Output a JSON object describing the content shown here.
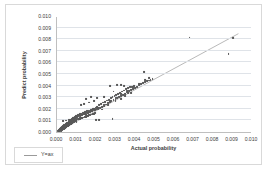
{
  "chart_data": {
    "type": "scatter",
    "title": "",
    "xlabel": "Actual probability",
    "ylabel": "Predict probability",
    "xlim": [
      0.0,
      0.01
    ],
    "ylim": [
      0.0,
      0.01
    ],
    "xticks": [
      "0.000",
      "0.001",
      "0.002",
      "0.003",
      "0.004",
      "0.005",
      "0.006",
      "0.007",
      "0.008",
      "0.009",
      "0.010"
    ],
    "yticks": [
      "0.000",
      "0.001",
      "0.002",
      "0.003",
      "0.004",
      "0.005",
      "0.006",
      "0.007",
      "0.008",
      "0.009",
      "0.010"
    ],
    "xtick_values": [
      0.0,
      0.001,
      0.002,
      0.003,
      0.004,
      0.005,
      0.006,
      0.007,
      0.008,
      0.009,
      0.01
    ],
    "ytick_values": [
      0.0,
      0.001,
      0.002,
      0.003,
      0.004,
      0.005,
      0.006,
      0.007,
      0.008,
      0.009,
      0.01
    ],
    "grid": "horizontal",
    "legend_position": "below-left",
    "legend": [
      {
        "label": "Y=ax",
        "marker": "line",
        "color": "#9a9a9a"
      }
    ],
    "series": [
      {
        "name": "scatter-points",
        "type": "scatter",
        "color": "#595959",
        "marker": "diamond",
        "points": [
          [
            5e-05,
            8e-05
          ],
          [
            8e-05,
            0.00012
          ],
          [
            0.0001,
            6e-05
          ],
          [
            0.00011,
            0.00018
          ],
          [
            0.00012,
            0.0001
          ],
          [
            0.00013,
            0.00022
          ],
          [
            0.00014,
            0.00014
          ],
          [
            0.00015,
            0.00026
          ],
          [
            0.00016,
            0.00018
          ],
          [
            0.00017,
            0.0003
          ],
          [
            0.00018,
            0.00021
          ],
          [
            0.00019,
            0.00013
          ],
          [
            0.0002,
            0.00034
          ],
          [
            0.00021,
            0.00024
          ],
          [
            0.00022,
            0.00016
          ],
          [
            0.00023,
            0.00038
          ],
          [
            0.00024,
            0.00028
          ],
          [
            0.00025,
            0.00019
          ],
          [
            0.00026,
            0.00042
          ],
          [
            0.00027,
            0.00031
          ],
          [
            0.00028,
            0.00022
          ],
          [
            0.00029,
            0.00046
          ],
          [
            0.0003,
            0.00035
          ],
          [
            0.00031,
            0.00025
          ],
          [
            0.00032,
            0.0005
          ],
          [
            0.00033,
            0.00039
          ],
          [
            0.00034,
            0.00028
          ],
          [
            0.00035,
            0.00054
          ],
          [
            0.00036,
            0.00043
          ],
          [
            0.00037,
            0.00031
          ],
          [
            0.00038,
            0.00058
          ],
          [
            0.00039,
            0.00047
          ],
          [
            0.0004,
            0.00035
          ],
          [
            0.00041,
            0.00062
          ],
          [
            0.00042,
            0.00051
          ],
          [
            0.00043,
            0.00038
          ],
          [
            0.00044,
            0.00066
          ],
          [
            0.00045,
            0.00055
          ],
          [
            0.00046,
            0.00042
          ],
          [
            0.00047,
            0.0007
          ],
          [
            0.00048,
            0.00059
          ],
          [
            0.00049,
            0.00045
          ],
          [
            0.0005,
            0.00074
          ],
          [
            0.00051,
            0.00063
          ],
          [
            0.00052,
            0.00049
          ],
          [
            0.00053,
            0.00078
          ],
          [
            0.00054,
            0.00067
          ],
          [
            0.00055,
            0.00052
          ],
          [
            0.00056,
            0.00082
          ],
          [
            0.00057,
            0.00071
          ],
          [
            0.00058,
            0.00056
          ],
          [
            0.00059,
            0.00086
          ],
          [
            0.0006,
            0.00075
          ],
          [
            0.00061,
            0.00059
          ],
          [
            0.00062,
            0.0009
          ],
          [
            0.00063,
            0.00079
          ],
          [
            0.00064,
            0.00063
          ],
          [
            0.00065,
            0.00094
          ],
          [
            0.00066,
            0.00083
          ],
          [
            0.00067,
            0.00066
          ],
          [
            0.00068,
            0.00098
          ],
          [
            0.00069,
            0.00087
          ],
          [
            0.0007,
            0.0007
          ],
          [
            0.00071,
            0.00102
          ],
          [
            0.00072,
            0.00091
          ],
          [
            0.00073,
            0.00073
          ],
          [
            0.00074,
            0.00106
          ],
          [
            0.00075,
            0.00095
          ],
          [
            0.00076,
            0.00077
          ],
          [
            0.00077,
            0.0011
          ],
          [
            0.00078,
            0.00099
          ],
          [
            0.00079,
            0.0008
          ],
          [
            0.0008,
            0.00114
          ],
          [
            0.00081,
            0.00103
          ],
          [
            0.00082,
            0.00084
          ],
          [
            0.00083,
            0.00118
          ],
          [
            0.00084,
            0.00107
          ],
          [
            0.00085,
            0.00088
          ],
          [
            0.00086,
            0.00122
          ],
          [
            0.00087,
            0.00111
          ],
          [
            0.00088,
            0.00091
          ],
          [
            0.00089,
            0.00126
          ],
          [
            0.0009,
            0.00115
          ],
          [
            0.00091,
            0.00095
          ],
          [
            0.00092,
            0.0013
          ],
          [
            0.00093,
            0.00119
          ],
          [
            0.00094,
            0.00098
          ],
          [
            0.00095,
            0.00134
          ],
          [
            0.00096,
            0.00123
          ],
          [
            0.00097,
            0.00102
          ],
          [
            0.00098,
            0.00138
          ],
          [
            0.00099,
            0.00127
          ],
          [
            0.001,
            0.00105
          ],
          [
            0.00102,
            0.00142
          ],
          [
            0.00104,
            0.00131
          ],
          [
            0.00106,
            0.00109
          ],
          [
            0.00108,
            0.00146
          ],
          [
            0.0011,
            0.00135
          ],
          [
            0.00112,
            0.00112
          ],
          [
            0.00114,
            0.0015
          ],
          [
            0.00116,
            0.00139
          ],
          [
            0.00118,
            0.00116
          ],
          [
            0.0012,
            0.00154
          ],
          [
            0.00122,
            0.00143
          ],
          [
            0.00124,
            0.00119
          ],
          [
            0.00126,
            0.00158
          ],
          [
            0.00128,
            0.00147
          ],
          [
            0.0013,
            0.00123
          ],
          [
            0.00132,
            0.00162
          ],
          [
            0.00134,
            0.00151
          ],
          [
            0.00136,
            0.00126
          ],
          [
            0.00138,
            0.00166
          ],
          [
            0.0014,
            0.00155
          ],
          [
            0.00142,
            0.0013
          ],
          [
            0.00144,
            0.0017
          ],
          [
            0.00146,
            0.00159
          ],
          [
            0.00148,
            0.00133
          ],
          [
            0.0015,
            0.00174
          ],
          [
            0.00152,
            0.00163
          ],
          [
            0.00154,
            0.00137
          ],
          [
            0.00156,
            0.00178
          ],
          [
            0.00158,
            0.00167
          ],
          [
            0.0016,
            0.0014
          ],
          [
            0.00162,
            0.00182
          ],
          [
            0.00164,
            0.00171
          ],
          [
            0.00166,
            0.00144
          ],
          [
            0.00168,
            0.00186
          ],
          [
            0.0017,
            0.00175
          ],
          [
            0.00172,
            0.00147
          ],
          [
            0.00174,
            0.0019
          ],
          [
            0.00176,
            0.00179
          ],
          [
            0.00178,
            0.00151
          ],
          [
            0.0018,
            0.00194
          ],
          [
            0.00182,
            0.00183
          ],
          [
            0.00184,
            0.00154
          ],
          [
            0.00186,
            0.00198
          ],
          [
            0.00188,
            0.00187
          ],
          [
            0.0019,
            0.00158
          ],
          [
            0.00192,
            0.00202
          ],
          [
            0.00194,
            0.00191
          ],
          [
            0.00196,
            0.00161
          ],
          [
            0.00198,
            0.00206
          ],
          [
            0.002,
            0.00195
          ],
          [
            0.00205,
            0.00215
          ],
          [
            0.0021,
            0.002
          ],
          [
            0.00215,
            0.00235
          ],
          [
            0.0022,
            0.0021
          ],
          [
            0.00225,
            0.00245
          ],
          [
            0.0023,
            0.00218
          ],
          [
            0.00235,
            0.00255
          ],
          [
            0.0024,
            0.00228
          ],
          [
            0.00245,
            0.00262
          ],
          [
            0.0025,
            0.00238
          ],
          [
            0.00255,
            0.00272
          ],
          [
            0.0026,
            0.00248
          ],
          [
            0.00265,
            0.0028
          ],
          [
            0.0027,
            0.00256
          ],
          [
            0.00275,
            0.00292
          ],
          [
            0.0028,
            0.00266
          ],
          [
            0.00285,
            0.003
          ],
          [
            0.0029,
            0.00276
          ],
          [
            0.00295,
            0.0031
          ],
          [
            0.003,
            0.00285
          ],
          [
            0.00305,
            0.0032
          ],
          [
            0.0031,
            0.00295
          ],
          [
            0.00315,
            0.0033
          ],
          [
            0.0032,
            0.00302
          ],
          [
            0.00325,
            0.0034
          ],
          [
            0.0033,
            0.00312
          ],
          [
            0.00335,
            0.0035
          ],
          [
            0.0034,
            0.00322
          ],
          [
            0.00345,
            0.00358
          ],
          [
            0.0035,
            0.00332
          ],
          [
            0.00355,
            0.00368
          ],
          [
            0.0036,
            0.00342
          ],
          [
            0.00365,
            0.00378
          ],
          [
            0.0037,
            0.00352
          ],
          [
            0.00375,
            0.00385
          ],
          [
            0.0038,
            0.00362
          ],
          [
            0.00385,
            0.00392
          ],
          [
            0.0039,
            0.00372
          ],
          [
            0.00395,
            0.00398
          ],
          [
            0.004,
            0.00382
          ],
          [
            0.0041,
            0.00392
          ],
          [
            0.0042,
            0.00402
          ],
          [
            0.0043,
            0.00412
          ],
          [
            0.0044,
            0.0042
          ],
          [
            0.0045,
            0.0043
          ],
          [
            0.0046,
            0.00438
          ],
          [
            0.0047,
            0.00445
          ],
          [
            0.0048,
            0.00452
          ],
          [
            0.0049,
            0.00458
          ],
          [
            0.00048,
            0.001
          ],
          [
            0.0006,
            0.00102
          ],
          [
            0.00075,
            0.00104
          ],
          [
            0.0003,
            0.00098
          ],
          [
            0.002,
            0.00105
          ],
          [
            0.00215,
            0.00102
          ],
          [
            0.00285,
            0.0011
          ],
          [
            0.001,
            0.00085
          ],
          [
            0.00125,
            0.0023
          ],
          [
            0.0014,
            0.00245
          ],
          [
            0.00165,
            0.00255
          ],
          [
            0.0019,
            0.00268
          ],
          [
            0.00205,
            0.0029
          ],
          [
            0.0024,
            0.003
          ],
          [
            0.00175,
            0.003
          ],
          [
            0.0015,
            0.00285
          ],
          [
            0.0027,
            0.004
          ],
          [
            0.0031,
            0.00402
          ],
          [
            0.0033,
            0.00408
          ],
          [
            0.0029,
            0.0035
          ],
          [
            0.0033,
            0.00285
          ],
          [
            0.003,
            0.00265
          ],
          [
            0.0026,
            0.00235
          ],
          [
            0.0023,
            0.00195
          ],
          [
            0.0035,
            0.0031
          ],
          [
            0.0038,
            0.0034
          ],
          [
            0.00345,
            0.00395
          ],
          [
            0.00365,
            0.0034
          ],
          [
            0.00445,
            0.0052
          ],
          [
            0.0068,
            0.00815
          ],
          [
            0.00905,
            0.0081
          ],
          [
            0.0088,
            0.00675
          ],
          [
            0.0004,
            0.0004
          ],
          [
            0.0006,
            0.00058
          ],
          [
            0.0009,
            0.00088
          ],
          [
            0.0012,
            0.00118
          ],
          [
            0.0015,
            0.00148
          ],
          [
            0.0018,
            0.00178
          ],
          [
            0.0021,
            0.00208
          ],
          [
            0.0024,
            0.00238
          ],
          [
            0.0027,
            0.00268
          ],
          [
            0.003,
            0.00298
          ],
          [
            0.0033,
            0.00328
          ],
          [
            0.0036,
            0.00358
          ],
          [
            0.0039,
            0.00388
          ],
          [
            0.0042,
            0.00418
          ],
          [
            0.0045,
            0.00448
          ],
          [
            0.0047,
            0.00465
          ]
        ]
      },
      {
        "name": "Y=ax",
        "type": "line",
        "color": "#9a9a9a",
        "line_from": [
          0.00022,
          0.0002
        ],
        "line_to": [
          0.00935,
          0.00855
        ]
      }
    ]
  }
}
